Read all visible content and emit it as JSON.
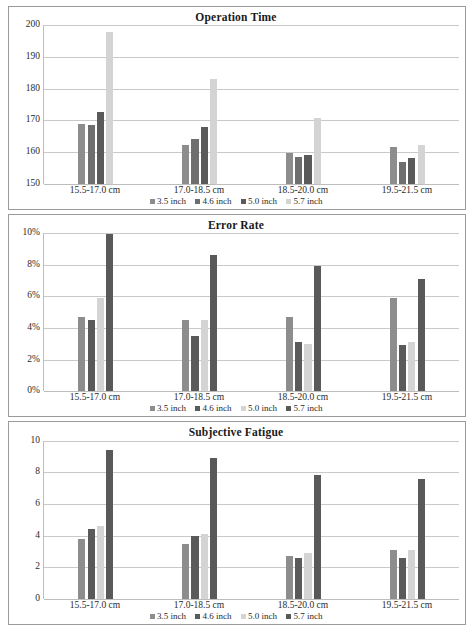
{
  "figure": {
    "categories": [
      "15.5-17.0 cm",
      "17.0-18.5 cm",
      "18.5-20.0 cm",
      "19.5-21.5 cm"
    ],
    "series_names": [
      "3.5 inch",
      "4.6 inch",
      "5.0 inch",
      "5.7 inch"
    ],
    "panel_border_color": "#9a9a9a",
    "gridline_color": "#c9c9c9"
  },
  "chart_data": [
    {
      "type": "bar",
      "title": "Operation Time",
      "xlabel": "",
      "ylabel": "",
      "ylim": [
        150,
        200
      ],
      "yticks": [
        150,
        160,
        170,
        180,
        190,
        200
      ],
      "ytick_labels": [
        "150",
        "160",
        "170",
        "180",
        "190",
        "200"
      ],
      "grid": true,
      "legend_position": "bottom",
      "categories": [
        "15.5-17.0 cm",
        "17.0-18.5 cm",
        "18.5-20.0 cm",
        "19.5-21.5 cm"
      ],
      "series": [
        {
          "name": "3.5 inch",
          "color": "#8d8d8d",
          "values": [
            169.0,
            162.3,
            159.7,
            161.5
          ]
        },
        {
          "name": "4.6 inch",
          "color": "#6e6e6e",
          "values": [
            168.7,
            164.2,
            158.5,
            157.0
          ]
        },
        {
          "name": "5.0 inch",
          "color": "#5a5a5a",
          "values": [
            172.6,
            167.9,
            159.1,
            158.1
          ]
        },
        {
          "name": "5.7 inch",
          "color": "#d4d4d4",
          "values": [
            198.0,
            183.1,
            170.6,
            162.2
          ]
        }
      ]
    },
    {
      "type": "bar",
      "title": "Error Rate",
      "xlabel": "",
      "ylabel": "",
      "ylim": [
        0,
        10
      ],
      "yticks": [
        0,
        2,
        4,
        6,
        8,
        10
      ],
      "ytick_labels": [
        "0%",
        "2%",
        "4%",
        "6%",
        "8%",
        "10%"
      ],
      "grid": true,
      "legend_position": "bottom",
      "categories": [
        "15.5-17.0 cm",
        "17.0-18.5 cm",
        "18.5-20.0 cm",
        "19.5-21.5 cm"
      ],
      "series": [
        {
          "name": "3.5 inch",
          "color": "#8d8d8d",
          "values": [
            4.7,
            4.5,
            4.7,
            5.9
          ]
        },
        {
          "name": "4.6 inch",
          "color": "#5a5a5a",
          "values": [
            4.5,
            3.5,
            3.1,
            2.9
          ]
        },
        {
          "name": "5.0 inch",
          "color": "#d4d4d4",
          "values": [
            5.9,
            4.5,
            3.0,
            3.1
          ]
        },
        {
          "name": "5.7 inch",
          "color": "#595959",
          "values": [
            9.9,
            8.6,
            7.9,
            7.1
          ]
        }
      ]
    },
    {
      "type": "bar",
      "title": "Subjective Fatigue",
      "xlabel": "",
      "ylabel": "",
      "ylim": [
        0,
        10
      ],
      "yticks": [
        0,
        2,
        4,
        6,
        8,
        10
      ],
      "ytick_labels": [
        "0",
        "2",
        "4",
        "6",
        "8",
        "10"
      ],
      "grid": true,
      "legend_position": "bottom",
      "categories": [
        "15.5-17.0 cm",
        "17.0-18.5 cm",
        "18.5-20.0 cm",
        "19.5-21.5 cm"
      ],
      "series": [
        {
          "name": "3.5 inch",
          "color": "#8d8d8d",
          "values": [
            3.8,
            3.5,
            2.7,
            3.1
          ]
        },
        {
          "name": "4.6 inch",
          "color": "#5a5a5a",
          "values": [
            4.4,
            4.0,
            2.6,
            2.6
          ]
        },
        {
          "name": "5.0 inch",
          "color": "#d4d4d4",
          "values": [
            4.6,
            4.1,
            2.9,
            3.1
          ]
        },
        {
          "name": "5.7 inch",
          "color": "#595959",
          "values": [
            9.4,
            8.9,
            7.8,
            7.6
          ]
        }
      ]
    }
  ]
}
